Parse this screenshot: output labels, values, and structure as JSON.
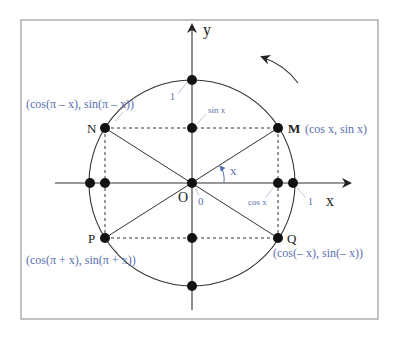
{
  "diagram": {
    "colors": {
      "frame": "#9a9a9a",
      "axis": "#333333",
      "circle": "#333333",
      "point": "#111111",
      "label_blue": "#5a6fb0",
      "label_black": "#222222"
    },
    "axes": {
      "x_label": "x",
      "y_label": "y"
    },
    "origin": {
      "label": "O",
      "zero_label": "0"
    },
    "tick_labels": {
      "x_one": "1",
      "y_one": "1",
      "cos_x": "cos x",
      "sin_x": "sin x"
    },
    "angle_label": "x",
    "points": [
      {
        "name": "M",
        "coords": "(cos x, sin x)"
      },
      {
        "name": "N",
        "coords": "(cos(π – x), sin(π – x))"
      },
      {
        "name": "P",
        "coords": "(cos(π + x), sin(π + x))"
      },
      {
        "name": "Q",
        "coords": "(cos(– x), sin(– x))"
      }
    ],
    "rotation_arrow": "counterclockwise"
  }
}
